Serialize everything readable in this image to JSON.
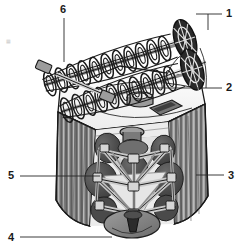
{
  "figure": {
    "background_color": "#ffffff",
    "line_color": "#1a1a1a",
    "corner_mark": "▦"
  },
  "palette": {
    "ink": "#1a1a1a",
    "leader": "#262626",
    "panel_light": "#f2f2f2",
    "panel_mid": "#b9b9b9",
    "panel_dark": "#6e6e6e",
    "panel_darker": "#4a4a4a",
    "disc_dark": "#585858",
    "disc_darker": "#3f3f3f",
    "frame_gray": "#9a9a9a",
    "frame_light": "#d8d8d8",
    "deck_white": "#fbfbfb",
    "cone_gray": "#8a8a8a",
    "shadow": "#2e2e2e"
  },
  "callouts": [
    {
      "id": "callout-1",
      "label": "1",
      "x": 226,
      "y": 8,
      "target": "cage-drum-assembly"
    },
    {
      "id": "callout-2",
      "label": "2",
      "x": 226,
      "y": 82,
      "target": "top-deck-hub"
    },
    {
      "id": "callout-3",
      "label": "3",
      "x": 228,
      "y": 170,
      "target": "corrugated-side-panel-right"
    },
    {
      "id": "callout-4",
      "label": "4",
      "x": 8,
      "y": 232,
      "target": "bottom-cone-hopper"
    },
    {
      "id": "callout-5",
      "label": "5",
      "x": 8,
      "y": 170,
      "target": "internal-disc-element"
    },
    {
      "id": "callout-6",
      "label": "6",
      "x": 60,
      "y": 4,
      "target": "helical-auger-rotor"
    }
  ],
  "parts": {
    "auger_upper": "upper helical auger rotor",
    "auger_lower": "lower helical auger rotor",
    "drum_upper": "upper cage drum end",
    "drum_lower": "lower cage drum end",
    "deck": "top deck plate",
    "hub": "top deck hub cylinder",
    "panel_left": "corrugated side panel left",
    "panel_right": "corrugated side panel right",
    "frame": "internal tubular truss frame",
    "discs": "internal disc elements",
    "cone": "bottom cone hopper",
    "shaft_stub": "drive shaft stub"
  }
}
